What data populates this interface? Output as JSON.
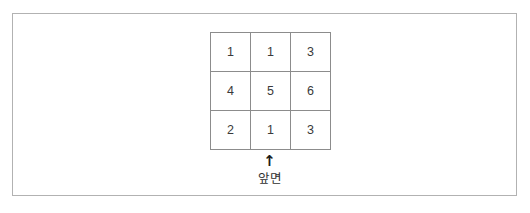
{
  "figure": {
    "frame": {
      "border_color": "#b2b2b2",
      "background": "#ffffff"
    },
    "grid": {
      "rows": [
        [
          "1",
          "1",
          "3"
        ],
        [
          "4",
          "5",
          "6"
        ],
        [
          "2",
          "1",
          "3"
        ]
      ],
      "border_color": "#8c8c8c",
      "text_color": "#3a3a3a",
      "columns": 3,
      "row_count": 3
    },
    "arrow": {
      "glyph": "↑",
      "icon_name": "arrow-up-icon",
      "direction": "up",
      "color": "#1c1c1c"
    },
    "caption": {
      "text": "앞면",
      "color": "#303030"
    }
  }
}
